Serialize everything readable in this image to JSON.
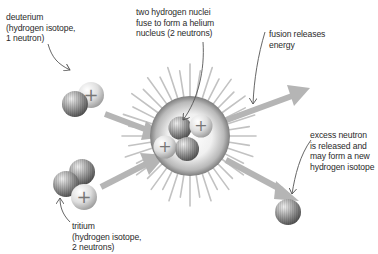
{
  "labels": {
    "deuterium": "deuterium\n(hydrogen isotope,\n1 neutron)",
    "fusion_nuclei": "two hydrogen nuclei\nfuse to form a helium\nnucleus (2 neutrons)",
    "energy": "fusion releases\nenergy",
    "excess_neutron": "excess neutron\nis released and\nmay form a new\nhydrogen isotope",
    "tritium": "tritium\n(hydrogen isotope,\n2 neutrons)"
  },
  "particles": {
    "proton_symbol": "+",
    "legend": {
      "proton": "light sphere with plus sign",
      "neutron": "dark striped sphere"
    }
  },
  "colors": {
    "background": "#ffffff",
    "arrow": "#b5b5b5",
    "spikes": "#bdbdbd",
    "text": "#2a2a2a",
    "pointer_line": "#555555",
    "neutron_dark": "#6e6e6e",
    "proton_light": "#d9d9d9"
  }
}
